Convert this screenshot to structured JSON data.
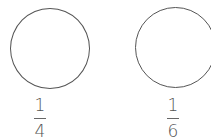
{
  "figures": [
    {
      "shape": "circle",
      "fraction": {
        "numerator": "1",
        "denominator": "4"
      }
    },
    {
      "shape": "circle",
      "fraction": {
        "numerator": "1",
        "denominator": "6"
      }
    }
  ],
  "colors": {
    "stroke": "#555555",
    "background": "#ffffff"
  }
}
